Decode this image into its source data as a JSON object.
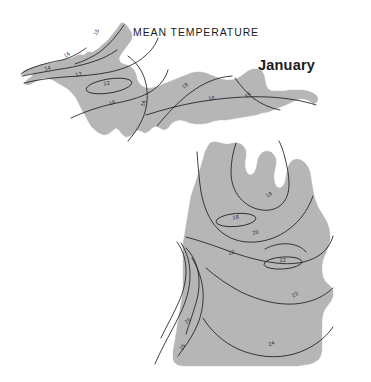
{
  "figure": {
    "title": "MEAN TEMPERATURE",
    "subtitle": "January",
    "region_name": "Michigan",
    "colors": {
      "land_fill": "#b6b6b6",
      "contour_line": "#1d1d1d",
      "background": "#ffffff",
      "text": "#1b1b1b"
    }
  },
  "chart_data": {
    "type": "contour-map",
    "title": "MEAN TEMPERATURE",
    "subtitle": "January",
    "variable": "Mean temperature",
    "period": "January",
    "units": "degrees Fahrenheit",
    "region": "Michigan",
    "contour_interval": 1,
    "value_range": [
      12,
      26
    ],
    "grid": false,
    "legend": "none",
    "xlabel": "",
    "ylabel": "",
    "labels": [
      {
        "id": "up-15",
        "value": "15",
        "x": 98,
        "y": 33,
        "rotate": -62,
        "area": "upper-peninsula-keweenaw"
      },
      {
        "id": "up-16-nw",
        "value": "16",
        "x": 68,
        "y": 56,
        "rotate": -34,
        "area": "upper-peninsula-northwest"
      },
      {
        "id": "up-14-w",
        "value": "14",
        "x": 48,
        "y": 70,
        "rotate": -14,
        "area": "upper-peninsula-west"
      },
      {
        "id": "up-13",
        "value": "13",
        "x": 79,
        "y": 76,
        "rotate": -12,
        "area": "upper-peninsula-west-central"
      },
      {
        "id": "up-12",
        "value": "12",
        "x": 107,
        "y": 85,
        "rotate": -10,
        "area": "upper-peninsula-cold-core"
      },
      {
        "id": "up-14-s",
        "value": "14",
        "x": 113,
        "y": 104,
        "rotate": -30,
        "area": "upper-peninsula-south-central"
      },
      {
        "id": "up-16-c",
        "value": "16",
        "x": 145,
        "y": 104,
        "rotate": -72,
        "area": "upper-peninsula-central"
      },
      {
        "id": "up-18-n",
        "value": "18",
        "x": 186,
        "y": 87,
        "rotate": -34,
        "area": "upper-peninsula-north"
      },
      {
        "id": "up-18-e",
        "value": "18",
        "x": 212,
        "y": 100,
        "rotate": -10,
        "area": "upper-peninsula-east"
      },
      {
        "id": "up-16-e",
        "value": "16",
        "x": 249,
        "y": 96,
        "rotate": -44,
        "area": "upper-peninsula-far-east"
      },
      {
        "id": "lp-18-core",
        "value": "18",
        "x": 236,
        "y": 219,
        "rotate": -8,
        "area": "lower-peninsula-north-cold-core"
      },
      {
        "id": "lp-18-ne",
        "value": "18",
        "x": 270,
        "y": 196,
        "rotate": -32,
        "area": "lower-peninsula-northeast"
      },
      {
        "id": "lp-20",
        "value": "20",
        "x": 256,
        "y": 234,
        "rotate": -14,
        "area": "lower-peninsula-north-central"
      },
      {
        "id": "lp-22-w",
        "value": "22",
        "x": 232,
        "y": 254,
        "rotate": -16,
        "area": "lower-peninsula-central-west"
      },
      {
        "id": "lp-22-core",
        "value": "22",
        "x": 283,
        "y": 262,
        "rotate": -6,
        "area": "lower-peninsula-central-cold-core"
      },
      {
        "id": "lp-23",
        "value": "23",
        "x": 296,
        "y": 296,
        "rotate": -34,
        "area": "lower-peninsula-southeast"
      },
      {
        "id": "lp-26",
        "value": "26",
        "x": 189,
        "y": 322,
        "rotate": -46,
        "area": "lower-peninsula-southwest-warm-core"
      },
      {
        "id": "lp-25",
        "value": "25",
        "x": 184,
        "y": 348,
        "rotate": -50,
        "area": "lower-peninsula-southwest"
      },
      {
        "id": "lp-24",
        "value": "24",
        "x": 272,
        "y": 345,
        "rotate": -16,
        "area": "lower-peninsula-south"
      }
    ],
    "series": [
      {
        "name": "12 °F isotherm",
        "value": 12,
        "closed": true,
        "region": "upper-peninsula"
      },
      {
        "name": "13 °F isotherm",
        "value": 13,
        "closed": false,
        "region": "upper-peninsula"
      },
      {
        "name": "14 °F isotherm",
        "value": 14,
        "closed": false,
        "region": "upper-peninsula"
      },
      {
        "name": "15 °F isotherm",
        "value": 15,
        "closed": false,
        "region": "upper-peninsula"
      },
      {
        "name": "16 °F isotherm",
        "value": 16,
        "closed": false,
        "region": "upper-peninsula"
      },
      {
        "name": "18 °F isotherm",
        "value": 18,
        "closed": false,
        "region": "upper-peninsula"
      },
      {
        "name": "18 °F isotherm (north LP core)",
        "value": 18,
        "closed": true,
        "region": "lower-peninsula"
      },
      {
        "name": "20 °F isotherm",
        "value": 20,
        "closed": false,
        "region": "lower-peninsula"
      },
      {
        "name": "22 °F isotherm",
        "value": 22,
        "closed": false,
        "region": "lower-peninsula"
      },
      {
        "name": "22 °F isotherm (thumb core)",
        "value": 22,
        "closed": true,
        "region": "lower-peninsula"
      },
      {
        "name": "23 °F isotherm",
        "value": 23,
        "closed": false,
        "region": "lower-peninsula"
      },
      {
        "name": "24 °F isotherm",
        "value": 24,
        "closed": false,
        "region": "lower-peninsula"
      },
      {
        "name": "25 °F isotherm",
        "value": 25,
        "closed": false,
        "region": "lower-peninsula"
      },
      {
        "name": "26 °F isotherm",
        "value": 26,
        "closed": false,
        "region": "lower-peninsula"
      }
    ]
  }
}
